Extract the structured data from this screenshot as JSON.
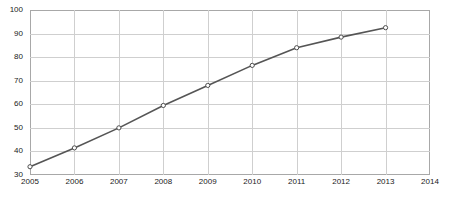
{
  "chart_data": {
    "type": "line",
    "title": "",
    "subtitle": "",
    "xlabel": "",
    "ylabel": "",
    "x": [
      2005,
      2006,
      2007,
      2008,
      2009,
      2010,
      2011,
      2012,
      2013
    ],
    "values": [
      33.5,
      41.5,
      50,
      59.5,
      68,
      76.5,
      84,
      88.5,
      92.5
    ],
    "series": [
      {
        "name": "series-1",
        "values": [
          33.5,
          41.5,
          50,
          59.5,
          68,
          76.5,
          84,
          88.5,
          92.5
        ]
      }
    ],
    "xlim": [
      2005,
      2014
    ],
    "ylim": [
      30,
      100
    ],
    "xticks": [
      2005,
      2006,
      2007,
      2008,
      2009,
      2010,
      2011,
      2012,
      2013,
      2014
    ],
    "xtick_labels": [
      "2005",
      "2006",
      "2007",
      "2008",
      "2009",
      "2010",
      "2011",
      "2012",
      "2013",
      "2014"
    ],
    "yticks": [
      30,
      40,
      50,
      60,
      70,
      80,
      90,
      100
    ],
    "ytick_labels": [
      "30",
      "40",
      "50",
      "60",
      "70",
      "80",
      "90",
      "100"
    ],
    "grid": true,
    "grid_axes": "both",
    "legend": false,
    "legend_position": "none",
    "marker": "open-circle",
    "annotations": [],
    "colors": {
      "line": "#555555",
      "marker_fill": "#ffffff",
      "marker_stroke": "#4d4d4d",
      "grid": "#cfcfcf",
      "axis_border": "#a8a8a8",
      "background": "#ffffff",
      "tick_text": "#1a1a1a"
    }
  }
}
